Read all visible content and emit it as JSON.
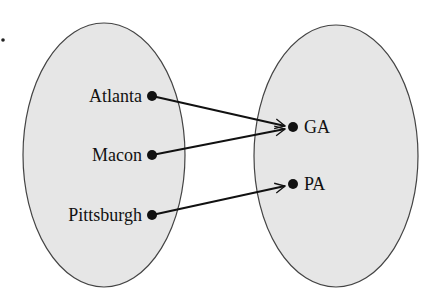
{
  "diagram": {
    "type": "mapping",
    "domain_set": {
      "elements": [
        {
          "label": "Atlanta",
          "x": 152,
          "y": 96
        },
        {
          "label": "Macon",
          "x": 152,
          "y": 155
        },
        {
          "label": "Pittsburgh",
          "x": 152,
          "y": 215
        }
      ]
    },
    "range_set": {
      "elements": [
        {
          "label": "GA",
          "x": 293,
          "y": 127
        },
        {
          "label": "PA",
          "x": 293,
          "y": 184
        }
      ]
    },
    "mappings": [
      {
        "from": "Atlanta",
        "to": "GA"
      },
      {
        "from": "Macon",
        "to": "GA"
      },
      {
        "from": "Pittsburgh",
        "to": "PA"
      }
    ],
    "colors": {
      "ellipse_fill": "#e6e6e6",
      "ellipse_stroke": "#444444",
      "ink": "#111111"
    }
  }
}
